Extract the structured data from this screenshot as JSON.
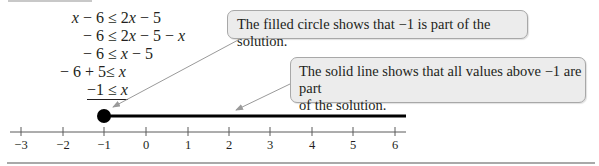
{
  "steps": [
    {
      "left": "x − 6",
      "rel": "≤",
      "right": "2x − 5"
    },
    {
      "left": "− 6",
      "rel": "≤",
      "right": "2x − 5 − x"
    },
    {
      "left": "− 6",
      "rel": "≤",
      "right": "x − 5"
    },
    {
      "left": "− 6 + 5",
      "rel": "≤",
      "right": "x"
    },
    {
      "left": "−1",
      "rel": "≤",
      "right": "x"
    }
  ],
  "callouts": {
    "circle": "The filled circle shows that −1 is part of the solution.",
    "line_1": "The solid line shows that all values above −1 are part",
    "line_2": "of the solution."
  },
  "number_line": {
    "ticks": [
      "−3",
      "−2",
      "−1",
      "0",
      "1",
      "2",
      "3",
      "4",
      "5",
      "6"
    ],
    "filled_point": "-1",
    "ray_direction": "right",
    "colors": {
      "axis": "#5a5a5a",
      "ray": "#000000",
      "callout_bg": "#ececec",
      "callout_border": "#a8a8a8",
      "arrow": "#9a9a9a"
    }
  }
}
